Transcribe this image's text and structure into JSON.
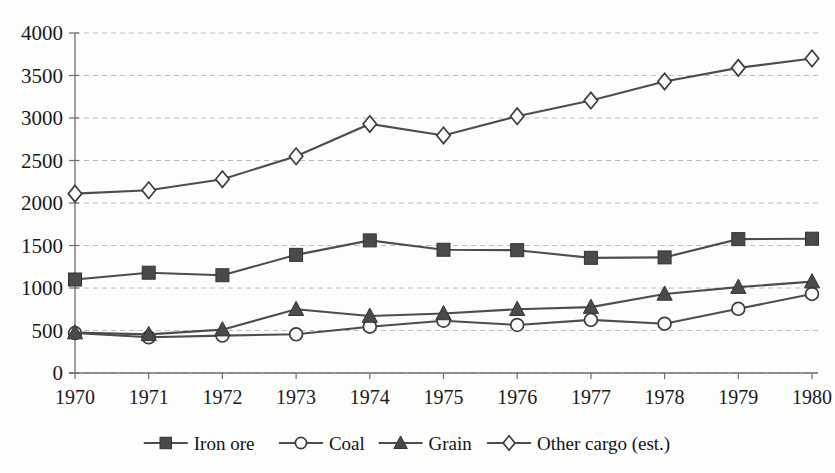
{
  "chart_data": {
    "type": "line",
    "title": "",
    "subtitle": "",
    "xlabel": "",
    "ylabel": "",
    "grid": true,
    "legend_position": "bottom",
    "x": [
      1970,
      1971,
      1972,
      1973,
      1974,
      1975,
      1976,
      1977,
      1978,
      1979,
      1980
    ],
    "categories": [
      "1970",
      "1971",
      "1972",
      "1973",
      "1974",
      "1975",
      "1976",
      "1977",
      "1978",
      "1979",
      "1980"
    ],
    "ylim": [
      0,
      4000
    ],
    "yticks": [
      0,
      500,
      1000,
      1500,
      2000,
      2500,
      3000,
      3500,
      4000
    ],
    "ytick_labels": [
      "0",
      "500",
      "1000",
      "1500",
      "2000",
      "2500",
      "3000",
      "3500",
      "4000"
    ],
    "series": [
      {
        "name": "Iron ore",
        "marker": "filled-square",
        "values": [
          1100,
          1180,
          1150,
          1390,
          1560,
          1450,
          1445,
          1355,
          1360,
          1575,
          1580
        ]
      },
      {
        "name": "Coal",
        "marker": "open-circle",
        "values": [
          470,
          420,
          440,
          455,
          545,
          615,
          565,
          625,
          580,
          755,
          930
        ]
      },
      {
        "name": "Grain",
        "marker": "filled-triangle",
        "values": [
          475,
          455,
          510,
          750,
          670,
          700,
          750,
          775,
          930,
          1010,
          1075
        ]
      },
      {
        "name": "Other cargo (est.)",
        "marker": "open-diamond",
        "values": [
          2110,
          2150,
          2280,
          2550,
          2930,
          2795,
          3020,
          3205,
          3430,
          3590,
          3700
        ]
      }
    ]
  },
  "legend": {
    "items": [
      {
        "label": "Iron ore",
        "marker": "filled-square"
      },
      {
        "label": "Coal",
        "marker": "open-circle"
      },
      {
        "label": "Grain",
        "marker": "filled-triangle"
      },
      {
        "label": "Other cargo (est.)",
        "marker": "open-diamond"
      }
    ]
  },
  "colors": {
    "line": "#4d4d4d",
    "marker_fill": "#4a4a4a",
    "marker_open_fill": "#fbfbfa",
    "grid": "#bcbcbc",
    "axis": "#6e6e6e",
    "text": "#191919",
    "background": "#fdfdfc"
  }
}
